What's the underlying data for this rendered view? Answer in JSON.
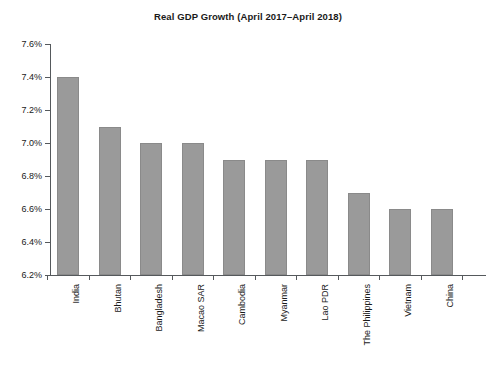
{
  "chart_data": {
    "type": "bar",
    "title": "Real GDP Growth (April 2017–April 2018)",
    "xlabel": "",
    "ylabel": "",
    "ylim": [
      6.2,
      7.6
    ],
    "ytick_step": 0.2,
    "ytick_labels": [
      "7.6%",
      "7.4%",
      "7.2%",
      "7.0%",
      "6.8%",
      "6.6%",
      "6.4%",
      "6.2%"
    ],
    "ytick_values": [
      7.6,
      7.4,
      7.2,
      7.0,
      6.8,
      6.6,
      6.4,
      6.2
    ],
    "value_suffix": "%",
    "grid": false,
    "legend": false,
    "bar_color": "#9a9a9a",
    "bar_edge_color": "#8a8a8a",
    "axis_color": "#55595c",
    "background_color": "#ffffff",
    "categories": [
      "India",
      "Bhutan",
      "Bangladesh",
      "Macao SAR",
      "Cambodia",
      "Myanmar",
      "Lao PDR",
      "The Philippines",
      "Vietnam",
      "China"
    ],
    "values": [
      7.4,
      7.1,
      7.0,
      7.0,
      6.9,
      6.9,
      6.9,
      6.7,
      6.6,
      6.6
    ]
  }
}
